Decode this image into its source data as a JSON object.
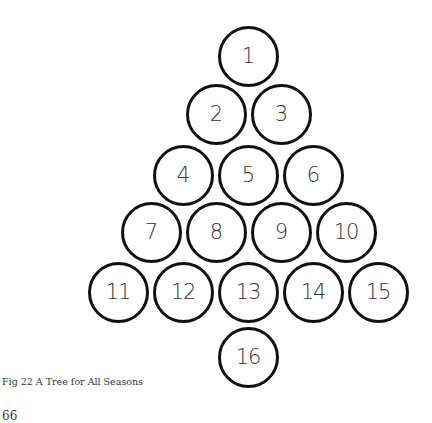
{
  "diagram": {
    "circles": [
      {
        "label": "1",
        "cx": 248,
        "cy": 56
      },
      {
        "label": "2",
        "cx": 216,
        "cy": 114
      },
      {
        "label": "3",
        "cx": 281,
        "cy": 114
      },
      {
        "label": "4",
        "cx": 183,
        "cy": 175
      },
      {
        "label": "5",
        "cx": 248,
        "cy": 175
      },
      {
        "label": "6",
        "cx": 313,
        "cy": 175
      },
      {
        "label": "7",
        "cx": 151,
        "cy": 232
      },
      {
        "label": "8",
        "cx": 216,
        "cy": 232
      },
      {
        "label": "9",
        "cx": 281,
        "cy": 232
      },
      {
        "label": "10",
        "cx": 346,
        "cy": 232
      },
      {
        "label": "11",
        "cx": 118,
        "cy": 292
      },
      {
        "label": "12",
        "cx": 183,
        "cy": 292
      },
      {
        "label": "13",
        "cx": 248,
        "cy": 292
      },
      {
        "label": "14",
        "cx": 313,
        "cy": 292
      },
      {
        "label": "15",
        "cx": 378,
        "cy": 292
      },
      {
        "label": "16",
        "cx": 248,
        "cy": 357
      }
    ],
    "stroke_color": "#111111"
  },
  "caption": "Fig 22    A Tree for All Seasons",
  "page_number": "66"
}
